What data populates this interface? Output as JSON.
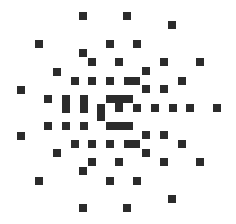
{
  "logo": {
    "description": "radial dot-matrix pattern of dark squares around a central C-shaped glyph",
    "color": "#2b2b2b",
    "background": "#ffffff",
    "cell": 8,
    "squares": [
      {
        "x": 79,
        "y": 12,
        "w": 8,
        "h": 8
      },
      {
        "x": 123,
        "y": 12,
        "w": 8,
        "h": 8
      },
      {
        "x": 168,
        "y": 21,
        "w": 8,
        "h": 8
      },
      {
        "x": 35,
        "y": 40,
        "w": 8,
        "h": 8
      },
      {
        "x": 106,
        "y": 40,
        "w": 8,
        "h": 8
      },
      {
        "x": 133,
        "y": 40,
        "w": 8,
        "h": 8
      },
      {
        "x": 79,
        "y": 49,
        "w": 8,
        "h": 8
      },
      {
        "x": 88,
        "y": 58,
        "w": 8,
        "h": 8
      },
      {
        "x": 115,
        "y": 58,
        "w": 8,
        "h": 8
      },
      {
        "x": 160,
        "y": 58,
        "w": 8,
        "h": 8
      },
      {
        "x": 196,
        "y": 58,
        "w": 8,
        "h": 8
      },
      {
        "x": 53,
        "y": 68,
        "w": 8,
        "h": 8
      },
      {
        "x": 142,
        "y": 67,
        "w": 8,
        "h": 8
      },
      {
        "x": 71,
        "y": 77,
        "w": 8,
        "h": 8
      },
      {
        "x": 88,
        "y": 77,
        "w": 8,
        "h": 8
      },
      {
        "x": 106,
        "y": 77,
        "w": 8,
        "h": 8
      },
      {
        "x": 124,
        "y": 77,
        "w": 16,
        "h": 8
      },
      {
        "x": 178,
        "y": 77,
        "w": 8,
        "h": 8
      },
      {
        "x": 17,
        "y": 86,
        "w": 8,
        "h": 8
      },
      {
        "x": 142,
        "y": 85,
        "w": 8,
        "h": 8
      },
      {
        "x": 160,
        "y": 85,
        "w": 8,
        "h": 8
      },
      {
        "x": 44,
        "y": 95,
        "w": 8,
        "h": 8
      },
      {
        "x": 62,
        "y": 95,
        "w": 8,
        "h": 18
      },
      {
        "x": 80,
        "y": 95,
        "w": 8,
        "h": 18
      },
      {
        "x": 106,
        "y": 95,
        "w": 27,
        "h": 8
      },
      {
        "x": 97,
        "y": 104,
        "w": 8,
        "h": 17
      },
      {
        "x": 115,
        "y": 103,
        "w": 8,
        "h": 9
      },
      {
        "x": 133,
        "y": 104,
        "w": 8,
        "h": 8
      },
      {
        "x": 151,
        "y": 104,
        "w": 8,
        "h": 8
      },
      {
        "x": 169,
        "y": 104,
        "w": 8,
        "h": 8
      },
      {
        "x": 186,
        "y": 104,
        "w": 8,
        "h": 8
      },
      {
        "x": 213,
        "y": 104,
        "w": 8,
        "h": 8
      },
      {
        "x": 106,
        "y": 122,
        "w": 27,
        "h": 8
      },
      {
        "x": 44,
        "y": 122,
        "w": 8,
        "h": 8
      },
      {
        "x": 62,
        "y": 122,
        "w": 8,
        "h": 8
      },
      {
        "x": 80,
        "y": 122,
        "w": 8,
        "h": 8
      },
      {
        "x": 17,
        "y": 132,
        "w": 8,
        "h": 8
      },
      {
        "x": 142,
        "y": 131,
        "w": 8,
        "h": 8
      },
      {
        "x": 160,
        "y": 131,
        "w": 8,
        "h": 8
      },
      {
        "x": 71,
        "y": 140,
        "w": 8,
        "h": 8
      },
      {
        "x": 88,
        "y": 140,
        "w": 8,
        "h": 8
      },
      {
        "x": 106,
        "y": 140,
        "w": 8,
        "h": 8
      },
      {
        "x": 124,
        "y": 140,
        "w": 16,
        "h": 8
      },
      {
        "x": 178,
        "y": 140,
        "w": 8,
        "h": 8
      },
      {
        "x": 53,
        "y": 149,
        "w": 8,
        "h": 8
      },
      {
        "x": 142,
        "y": 149,
        "w": 8,
        "h": 8
      },
      {
        "x": 88,
        "y": 158,
        "w": 8,
        "h": 8
      },
      {
        "x": 115,
        "y": 158,
        "w": 8,
        "h": 8
      },
      {
        "x": 160,
        "y": 158,
        "w": 8,
        "h": 8
      },
      {
        "x": 196,
        "y": 158,
        "w": 8,
        "h": 8
      },
      {
        "x": 79,
        "y": 167,
        "w": 8,
        "h": 8
      },
      {
        "x": 35,
        "y": 177,
        "w": 8,
        "h": 8
      },
      {
        "x": 106,
        "y": 177,
        "w": 8,
        "h": 8
      },
      {
        "x": 133,
        "y": 177,
        "w": 8,
        "h": 8
      },
      {
        "x": 168,
        "y": 195,
        "w": 8,
        "h": 8
      },
      {
        "x": 79,
        "y": 204,
        "w": 8,
        "h": 8
      },
      {
        "x": 123,
        "y": 204,
        "w": 8,
        "h": 8
      }
    ]
  }
}
